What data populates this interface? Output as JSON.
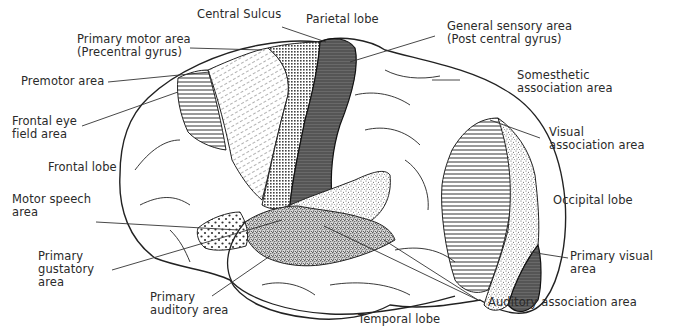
{
  "diagram": {
    "colors": {
      "ink": "#2a2a2a",
      "dark_fill": "#5a5a5a",
      "background": "#ffffff"
    },
    "labels": {
      "central_sulcus": "Central Sulcus",
      "parietal_lobe": "Parietal lobe",
      "primary_motor_area": "Primary motor area\n(Precentral gyrus)",
      "general_sensory_area": "General sensory area\n(Post central gyrus)",
      "premotor_area": "Premotor area",
      "somesthetic_association_area": "Somesthetic\nassociation area",
      "frontal_eye_field_area": "Frontal eye\nfield area",
      "visual_association_area": "Visual\nassociation area",
      "frontal_lobe": "Frontal lobe",
      "occipital_lobe": "Occipital lobe",
      "motor_speech_area": "Motor speech\narea",
      "primary_gustatory_area": "Primary\ngustatory\narea",
      "primary_visual_area": "Primary visual\narea",
      "primary_auditory_area": "Primary\nauditory area",
      "auditory_association_area": "Auditory association area",
      "temporal_lobe": "Temporal lobe"
    },
    "regions": [
      {
        "id": "frontal_eye_field_area",
        "pattern": "horizontal-lines"
      },
      {
        "id": "premotor_area",
        "pattern": "diagonal-dashes"
      },
      {
        "id": "primary_motor_area",
        "pattern": "fine-grid"
      },
      {
        "id": "general_sensory_area",
        "pattern": "dark-solid"
      },
      {
        "id": "motor_speech_area",
        "pattern": "sparse-dots"
      },
      {
        "id": "primary_gustatory_area",
        "pattern": "fine-stipple"
      },
      {
        "id": "primary_auditory_area",
        "pattern": "dense-stipple"
      },
      {
        "id": "auditory_association_area",
        "pattern": "dense-stipple"
      },
      {
        "id": "visual_association_area",
        "pattern": "horizontal-lines"
      },
      {
        "id": "visual_association_ring",
        "pattern": "fine-stipple"
      },
      {
        "id": "primary_visual_area",
        "pattern": "dark-solid"
      }
    ]
  }
}
